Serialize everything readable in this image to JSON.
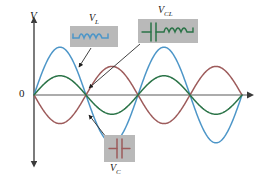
{
  "figure": {
    "title": "",
    "background": "#ffffff",
    "axes": {
      "v_axis_label": "V",
      "origin_label": "0",
      "axis_color": "#4d4d4d"
    },
    "callouts": [
      {
        "id": "vl",
        "label_text": "V",
        "label_sub": "L",
        "symbol": "inductor-icon",
        "color": "#4d96c8",
        "box": {
          "x": 70,
          "y": 26,
          "w": 48,
          "h": 21
        },
        "label_pos": {
          "x": 89,
          "y": 13
        },
        "pointer": {
          "x1": 91,
          "y1": 48,
          "x2": 79,
          "y2": 67
        }
      },
      {
        "id": "vcl",
        "label_text": "V",
        "label_sub": "CL",
        "symbol": "capacitor-inductor-icon",
        "color": "#2a7347",
        "box": {
          "x": 138,
          "y": 19,
          "w": 60,
          "h": 24
        },
        "label_pos": {
          "x": 158,
          "y": 5
        },
        "pointer": {
          "x1": 140,
          "y1": 44,
          "x2": 89,
          "y2": 88
        }
      },
      {
        "id": "vc",
        "label_text": "V",
        "label_sub": "C",
        "symbol": "capacitor-icon",
        "color": "#9d5b5b",
        "box": {
          "x": 104,
          "y": 135,
          "w": 31,
          "h": 27
        },
        "label_pos": {
          "x": 110,
          "y": 163
        },
        "pointer": {
          "x1": 106,
          "y1": 137,
          "x2": 89,
          "y2": 115
        }
      }
    ]
  },
  "chart_data": {
    "type": "line",
    "title": "",
    "xlabel": "",
    "ylabel": "V",
    "xlim": [
      0,
      2
    ],
    "ylim": [
      -1.05,
      1.05
    ],
    "grid": false,
    "legend": "callout-boxes",
    "x_unit": "cycles",
    "origin_tick": "0",
    "series": [
      {
        "name": "V_L",
        "label": "VL",
        "color": "#4d96c8",
        "amplitude": 0.92,
        "phase_deg": 0,
        "cycles": 2,
        "description": "Inductor voltage, largest amplitude, positive first half-cycle",
        "samples_x": [
          0,
          0.125,
          0.25,
          0.375,
          0.5,
          0.625,
          0.75,
          0.875,
          1.0,
          1.125,
          1.25,
          1.375,
          1.5,
          1.625,
          1.75,
          1.875,
          2.0
        ],
        "samples_y": [
          0,
          0.65,
          0.92,
          0.65,
          0,
          -0.65,
          -0.92,
          -0.65,
          0,
          0.65,
          0.92,
          0.65,
          0,
          -0.65,
          -0.92,
          -0.65,
          0
        ]
      },
      {
        "name": "V_C",
        "label": "VC",
        "color": "#9d5b5b",
        "amplitude": 0.55,
        "phase_deg": 180,
        "cycles": 2,
        "description": "Capacitor voltage, opposite sign to inductor voltage, medium amplitude",
        "samples_x": [
          0,
          0.125,
          0.25,
          0.375,
          0.5,
          0.625,
          0.75,
          0.875,
          1.0,
          1.125,
          1.25,
          1.375,
          1.5,
          1.625,
          1.75,
          1.875,
          2.0
        ],
        "samples_y": [
          0,
          -0.39,
          -0.55,
          -0.39,
          0,
          0.39,
          0.55,
          0.39,
          0,
          -0.39,
          -0.55,
          -0.39,
          0,
          0.39,
          0.55,
          0.39,
          0
        ]
      },
      {
        "name": "V_CL",
        "label": "VCL",
        "color": "#2a7347",
        "amplitude": 0.37,
        "phase_deg": 0,
        "cycles": 2,
        "description": "Net capacitor+inductor voltage, sum of the two, smallest amplitude",
        "samples_x": [
          0,
          0.125,
          0.25,
          0.375,
          0.5,
          0.625,
          0.75,
          0.875,
          1.0,
          1.125,
          1.25,
          1.375,
          1.5,
          1.625,
          1.75,
          1.875,
          2.0
        ],
        "samples_y": [
          0,
          0.26,
          0.37,
          0.26,
          0,
          -0.26,
          -0.37,
          -0.26,
          0,
          0.26,
          0.37,
          0.26,
          0,
          -0.26,
          -0.37,
          -0.26,
          0
        ]
      }
    ]
  }
}
